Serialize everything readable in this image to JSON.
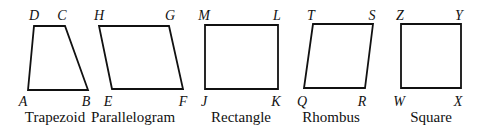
{
  "figure": {
    "shapes": [
      {
        "name": "Trapezoid",
        "points": "34,26 65,26 88,90 28,90",
        "name_pos": [
          55,
          122
        ],
        "vertices": [
          {
            "label": "D",
            "x": 34,
            "y": 20
          },
          {
            "label": "C",
            "x": 62,
            "y": 20
          },
          {
            "label": "A",
            "x": 23,
            "y": 106
          },
          {
            "label": "B",
            "x": 86,
            "y": 106
          }
        ]
      },
      {
        "name": "Parallelogram",
        "points": "99,26 169,26 183,89 112,89",
        "name_pos": [
          133,
          122
        ],
        "vertices": [
          {
            "label": "H",
            "x": 99,
            "y": 20
          },
          {
            "label": "G",
            "x": 170,
            "y": 20
          },
          {
            "label": "E",
            "x": 108,
            "y": 106
          },
          {
            "label": "F",
            "x": 183,
            "y": 106
          }
        ]
      },
      {
        "name": "Rectangle",
        "points": "205,25 278,25 278,89 205,89",
        "name_pos": [
          241,
          122
        ],
        "vertices": [
          {
            "label": "M",
            "x": 204,
            "y": 20
          },
          {
            "label": "L",
            "x": 277,
            "y": 20
          },
          {
            "label": "J",
            "x": 204,
            "y": 106
          },
          {
            "label": "K",
            "x": 276,
            "y": 106
          }
        ]
      },
      {
        "name": "Rhombus",
        "points": "313,24 373,24 365,88 304,88",
        "name_pos": [
          331,
          122
        ],
        "vertices": [
          {
            "label": "T",
            "x": 311,
            "y": 20
          },
          {
            "label": "S",
            "x": 372,
            "y": 20
          },
          {
            "label": "Q",
            "x": 302,
            "y": 106
          },
          {
            "label": "R",
            "x": 362,
            "y": 106
          }
        ]
      },
      {
        "name": "Square",
        "points": "401,24 461,24 461,88 401,88",
        "name_pos": [
          431,
          122
        ],
        "vertices": [
          {
            "label": "Z",
            "x": 400,
            "y": 20
          },
          {
            "label": "Y",
            "x": 459,
            "y": 20
          },
          {
            "label": "W",
            "x": 399,
            "y": 106
          },
          {
            "label": "X",
            "x": 458,
            "y": 106
          }
        ]
      }
    ]
  }
}
